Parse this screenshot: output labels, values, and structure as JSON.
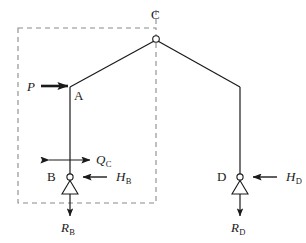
{
  "figure": {
    "type": "structural-free-body-diagram",
    "colors": {
      "line": "#1a1a1a",
      "dashed": "#8a8a8a",
      "background": "#ffffff"
    },
    "nodes": [
      {
        "id": "A",
        "label": "A",
        "x": 70,
        "y": 87,
        "label_x": 74,
        "label_y": 89
      },
      {
        "id": "B",
        "label": "B",
        "x": 70,
        "y": 177,
        "label_x": 47,
        "label_y": 171
      },
      {
        "id": "C",
        "label": "C",
        "x": 156,
        "y": 39,
        "label_x": 151,
        "label_y": 10
      },
      {
        "id": "D",
        "label": "D",
        "x": 240,
        "y": 177,
        "label_x": 217,
        "label_y": 171
      }
    ],
    "forces": [
      {
        "id": "P",
        "label": "P",
        "sub": "",
        "direction": "right",
        "applied_at": "A"
      },
      {
        "id": "QC",
        "label": "Q",
        "sub": "C",
        "direction": "bidirectional-horizontal",
        "applied_at": "AB-member"
      },
      {
        "id": "HB",
        "label": "H",
        "sub": "B",
        "direction": "left",
        "applied_at": "B"
      },
      {
        "id": "HD",
        "label": "H",
        "sub": "D",
        "direction": "left",
        "applied_at": "D"
      },
      {
        "id": "RB",
        "label": "R",
        "sub": "B",
        "direction": "down",
        "applied_at": "B"
      },
      {
        "id": "RD",
        "label": "R",
        "sub": "D",
        "direction": "down",
        "applied_at": "D"
      }
    ],
    "dashed_box": {
      "x": 18,
      "y": 28,
      "width": 138,
      "height": 175
    },
    "supports": [
      {
        "at": "B",
        "type": "pin-triangle"
      },
      {
        "at": "D",
        "type": "pin-triangle"
      }
    ]
  }
}
